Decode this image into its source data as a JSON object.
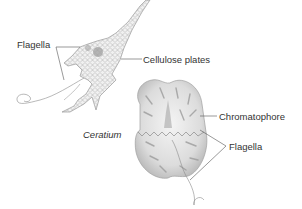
{
  "figure": {
    "organisms": [
      {
        "name": "Ceratium",
        "caption": "Ceratium",
        "labels": {
          "flagella": "Flagella",
          "cellulose_plates": "Cellulose plates"
        }
      },
      {
        "name": "unnamed-dinoflagellate",
        "labels": {
          "chromatophore": "Chromatophore",
          "flagella": "Flagella"
        }
      }
    ],
    "colors": {
      "background": "#ffffff",
      "line": "#555555",
      "cell_fill": "#e6e6e6",
      "cell_shade": "#9a9a9a",
      "text": "#333333"
    }
  }
}
